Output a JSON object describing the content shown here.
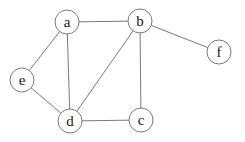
{
  "diagram": {
    "type": "undirected-graph",
    "node_radius": 12,
    "nodes": [
      {
        "id": "a",
        "label": "a",
        "x": 67,
        "y": 22
      },
      {
        "id": "b",
        "label": "b",
        "x": 140,
        "y": 21
      },
      {
        "id": "f",
        "label": "f",
        "x": 219,
        "y": 52
      },
      {
        "id": "e",
        "label": "e",
        "x": 22,
        "y": 80
      },
      {
        "id": "d",
        "label": "d",
        "x": 70,
        "y": 121
      },
      {
        "id": "c",
        "label": "c",
        "x": 141,
        "y": 120
      }
    ],
    "edges": [
      {
        "from": "a",
        "to": "b"
      },
      {
        "from": "a",
        "to": "e"
      },
      {
        "from": "a",
        "to": "d"
      },
      {
        "from": "b",
        "to": "f"
      },
      {
        "from": "b",
        "to": "d"
      },
      {
        "from": "b",
        "to": "c"
      },
      {
        "from": "e",
        "to": "d"
      },
      {
        "from": "d",
        "to": "c"
      }
    ]
  }
}
